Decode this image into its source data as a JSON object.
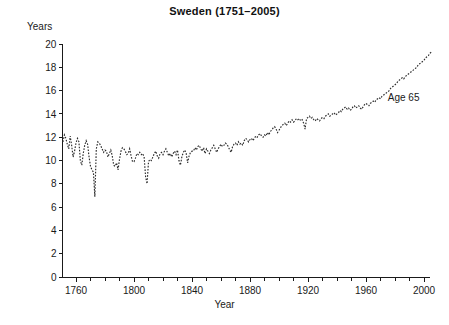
{
  "chart_data": {
    "type": "line",
    "title": "Sweden (1751–2005)",
    "xlabel": "Year",
    "ylabel": "Years",
    "xlim": [
      1751,
      2005
    ],
    "ylim": [
      0,
      20
    ],
    "grid": false,
    "legend_position": "inline-annotation",
    "annotations": [
      {
        "text": "Age 65",
        "x": 1975,
        "y": 15.3
      }
    ],
    "x_major_ticks": [
      1760,
      1800,
      1840,
      1880,
      1920,
      1960,
      2000
    ],
    "x_minor_tick_step": 10,
    "y_major_ticks": [
      0,
      2,
      4,
      6,
      8,
      10,
      12,
      14,
      16,
      18,
      20
    ],
    "series": [
      {
        "name": "Age 65",
        "style": "dotted",
        "color": "#2b2b2b",
        "x": [
          1751,
          1752,
          1753,
          1754,
          1755,
          1756,
          1757,
          1758,
          1759,
          1760,
          1761,
          1762,
          1763,
          1764,
          1765,
          1766,
          1767,
          1768,
          1769,
          1770,
          1771,
          1772,
          1773,
          1774,
          1775,
          1776,
          1777,
          1778,
          1779,
          1780,
          1781,
          1782,
          1783,
          1784,
          1785,
          1786,
          1787,
          1788,
          1789,
          1790,
          1791,
          1792,
          1793,
          1794,
          1795,
          1796,
          1797,
          1798,
          1799,
          1800,
          1801,
          1802,
          1803,
          1804,
          1805,
          1806,
          1807,
          1808,
          1809,
          1810,
          1811,
          1812,
          1813,
          1814,
          1815,
          1816,
          1817,
          1818,
          1819,
          1820,
          1821,
          1822,
          1823,
          1824,
          1825,
          1826,
          1827,
          1828,
          1829,
          1830,
          1831,
          1832,
          1833,
          1834,
          1835,
          1836,
          1837,
          1838,
          1839,
          1840,
          1841,
          1842,
          1843,
          1844,
          1845,
          1846,
          1847,
          1848,
          1849,
          1850,
          1851,
          1852,
          1853,
          1854,
          1855,
          1856,
          1857,
          1858,
          1859,
          1860,
          1861,
          1862,
          1863,
          1864,
          1865,
          1866,
          1867,
          1868,
          1869,
          1870,
          1871,
          1872,
          1873,
          1874,
          1875,
          1876,
          1877,
          1878,
          1879,
          1880,
          1881,
          1882,
          1883,
          1884,
          1885,
          1886,
          1887,
          1888,
          1889,
          1890,
          1891,
          1892,
          1893,
          1894,
          1895,
          1896,
          1897,
          1898,
          1899,
          1900,
          1901,
          1902,
          1903,
          1904,
          1905,
          1906,
          1907,
          1908,
          1909,
          1910,
          1911,
          1912,
          1913,
          1914,
          1915,
          1916,
          1917,
          1918,
          1919,
          1920,
          1921,
          1922,
          1923,
          1924,
          1925,
          1926,
          1927,
          1928,
          1929,
          1930,
          1931,
          1932,
          1933,
          1934,
          1935,
          1936,
          1937,
          1938,
          1939,
          1940,
          1941,
          1942,
          1943,
          1944,
          1945,
          1946,
          1947,
          1948,
          1949,
          1950,
          1951,
          1952,
          1953,
          1954,
          1955,
          1956,
          1957,
          1958,
          1959,
          1960,
          1961,
          1962,
          1963,
          1964,
          1965,
          1966,
          1967,
          1968,
          1969,
          1970,
          1971,
          1972,
          1973,
          1974,
          1975,
          1976,
          1977,
          1978,
          1979,
          1980,
          1981,
          1982,
          1983,
          1984,
          1985,
          1986,
          1987,
          1988,
          1989,
          1990,
          1991,
          1992,
          1993,
          1994,
          1995,
          1996,
          1997,
          1998,
          1999,
          2000,
          2001,
          2002,
          2003,
          2004,
          2005
        ],
        "y": [
          11.6,
          12.2,
          11.9,
          11.4,
          11.0,
          12.1,
          11.3,
          10.3,
          10.8,
          11.5,
          11.9,
          11.6,
          10.0,
          9.6,
          10.6,
          11.3,
          11.7,
          11.4,
          10.3,
          9.5,
          9.2,
          9.0,
          6.9,
          11.0,
          11.6,
          11.5,
          11.3,
          11.0,
          10.7,
          10.9,
          10.8,
          10.3,
          10.6,
          10.9,
          10.4,
          9.6,
          9.5,
          9.8,
          9.2,
          10.1,
          10.8,
          11.1,
          11.0,
          10.8,
          10.5,
          10.6,
          11.0,
          10.4,
          9.9,
          9.9,
          10.2,
          10.6,
          10.5,
          10.7,
          10.5,
          10.6,
          10.3,
          8.6,
          8.0,
          9.9,
          10.1,
          10.0,
          10.3,
          10.6,
          10.8,
          10.4,
          10.2,
          10.6,
          10.7,
          10.5,
          10.8,
          11.0,
          10.7,
          10.4,
          10.6,
          10.3,
          10.6,
          10.8,
          10.5,
          10.9,
          10.0,
          9.6,
          10.3,
          10.7,
          10.9,
          10.6,
          9.8,
          10.4,
          10.7,
          10.8,
          10.8,
          11.1,
          10.9,
          11.2,
          11.3,
          11.0,
          10.8,
          11.1,
          10.6,
          11.0,
          10.8,
          10.6,
          10.9,
          11.1,
          11.3,
          11.0,
          10.7,
          11.0,
          11.2,
          11.4,
          11.2,
          11.3,
          11.5,
          11.4,
          11.2,
          10.9,
          10.7,
          11.2,
          11.4,
          11.5,
          11.3,
          11.6,
          11.4,
          11.5,
          11.3,
          11.7,
          11.9,
          11.8,
          11.6,
          11.8,
          11.9,
          11.7,
          11.9,
          12.1,
          12.0,
          12.2,
          12.3,
          12.1,
          12.0,
          12.2,
          12.1,
          12.4,
          12.2,
          12.5,
          12.6,
          12.8,
          12.9,
          12.7,
          12.4,
          12.6,
          12.8,
          13.0,
          13.1,
          13.2,
          13.0,
          13.2,
          13.4,
          13.3,
          13.5,
          13.3,
          13.4,
          13.6,
          13.5,
          13.6,
          13.4,
          13.5,
          13.2,
          12.7,
          13.6,
          13.7,
          13.8,
          13.6,
          13.7,
          13.5,
          13.4,
          13.6,
          13.5,
          13.4,
          13.6,
          13.7,
          13.6,
          13.8,
          13.9,
          14.0,
          13.8,
          13.9,
          14.0,
          14.1,
          13.9,
          14.0,
          14.1,
          14.3,
          14.2,
          14.4,
          14.5,
          14.6,
          14.4,
          14.5,
          14.3,
          14.4,
          14.6,
          14.7,
          14.5,
          14.6,
          14.7,
          14.5,
          14.4,
          14.6,
          14.8,
          14.9,
          14.8,
          14.7,
          14.9,
          15.0,
          15.1,
          15.0,
          15.2,
          15.3,
          15.4,
          15.3,
          15.5,
          15.6,
          15.7,
          15.8,
          15.9,
          16.0,
          16.2,
          16.3,
          16.4,
          16.5,
          16.6,
          16.8,
          16.9,
          17.0,
          17.1,
          17.0,
          17.2,
          17.3,
          17.4,
          17.5,
          17.6,
          17.7,
          17.8,
          17.9,
          18.0,
          18.2,
          18.3,
          18.4,
          18.5,
          18.6,
          18.8,
          18.9,
          19.0,
          19.2,
          19.3
        ]
      }
    ]
  }
}
